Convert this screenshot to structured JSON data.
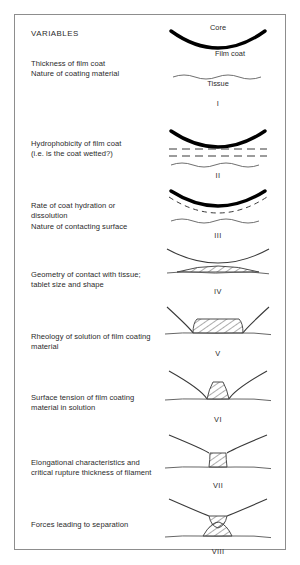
{
  "figure": {
    "heading": "VARIABLES",
    "annotations": {
      "core": "Core",
      "film_coat": "Film coat",
      "tissue": "Tissue"
    },
    "variables": [
      {
        "id": "thickness",
        "lines": "Thickness of film coat\nNature of coating material"
      },
      {
        "id": "hydrophobicity",
        "lines": "Hydrophobicity of film coat\n(i.e. is the coat wetted?)"
      },
      {
        "id": "hydration-rate",
        "lines": "Rate of coat hydration or\ndissolution\nNature of contacting surface"
      },
      {
        "id": "geometry",
        "lines": "Geometry of contact with tissue;\ntablet size and shape"
      },
      {
        "id": "rheology",
        "lines": "Rheology of solution of film coating\nmaterial"
      },
      {
        "id": "surface-tension",
        "lines": "Surface tension of film coating\nmaterial in solution"
      },
      {
        "id": "elongational",
        "lines": "Elongational characteristics and\ncritical rupture thickness of filament"
      },
      {
        "id": "forces",
        "lines": "Forces leading to separation"
      }
    ],
    "stages": [
      {
        "numeral": "I",
        "name": "coated-tablet-and-tissue-separate"
      },
      {
        "numeral": "II",
        "name": "film-coat-wetting"
      },
      {
        "numeral": "III",
        "name": "coat-hydration-dissolution"
      },
      {
        "numeral": "IV",
        "name": "contact-with-tissue"
      },
      {
        "numeral": "V",
        "name": "liquid-bridge-formed"
      },
      {
        "numeral": "VI",
        "name": "bridge-narrowing"
      },
      {
        "numeral": "VII",
        "name": "filament-elongation"
      },
      {
        "numeral": "VIII",
        "name": "filament-rupture"
      }
    ],
    "colors": {
      "frame": "#8d8d8d",
      "ink": "#2b2b2b",
      "core_line": "#000000",
      "background": "#ffffff"
    }
  }
}
